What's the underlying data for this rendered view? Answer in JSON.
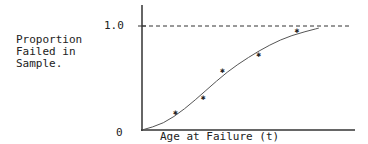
{
  "chart_data": {
    "type": "scatter",
    "title": "",
    "xlabel": "Age at Failure (t)",
    "ylabel": "Proportion Failed in Sample.",
    "ylabel_lines": [
      "Proportion",
      "Failed in",
      "Sample."
    ],
    "y_ticks": [
      "0",
      "1.0"
    ],
    "ylim": [
      0,
      1.0
    ],
    "xlim": [
      0,
      1
    ],
    "grid": false,
    "legend": null,
    "reference_line": {
      "y": 1.0,
      "style": "dashed"
    },
    "series": [
      {
        "name": "observed failures",
        "marker": "star",
        "points": [
          {
            "x": 0.16,
            "y": 0.17
          },
          {
            "x": 0.29,
            "y": 0.32
          },
          {
            "x": 0.38,
            "y": 0.58
          },
          {
            "x": 0.55,
            "y": 0.73
          },
          {
            "x": 0.73,
            "y": 0.96
          }
        ]
      },
      {
        "name": "fitted cumulative distribution curve",
        "type": "line",
        "points": [
          {
            "x": 0.0,
            "y": 0.0
          },
          {
            "x": 0.1,
            "y": 0.06
          },
          {
            "x": 0.2,
            "y": 0.2
          },
          {
            "x": 0.3,
            "y": 0.38
          },
          {
            "x": 0.4,
            "y": 0.56
          },
          {
            "x": 0.5,
            "y": 0.7
          },
          {
            "x": 0.6,
            "y": 0.82
          },
          {
            "x": 0.7,
            "y": 0.91
          },
          {
            "x": 0.83,
            "y": 0.98
          }
        ]
      }
    ]
  }
}
